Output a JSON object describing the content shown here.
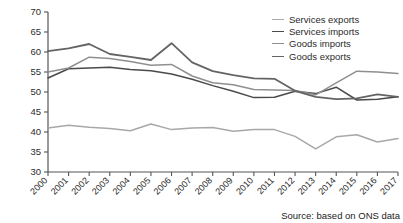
{
  "chart_data": {
    "type": "line",
    "title": "",
    "xlabel": "",
    "ylabel_line1": "% of UK exports and",
    "ylabel_line2": "imports with the EU",
    "ylim": [
      30,
      70
    ],
    "yticks": [
      30,
      35,
      40,
      45,
      50,
      55,
      60,
      65,
      70
    ],
    "grid": false,
    "legend_position": "top-right",
    "categories": [
      "2000",
      "2001",
      "2002",
      "2003",
      "2004",
      "2005",
      "2006",
      "2007",
      "2008",
      "2009",
      "2010",
      "2011",
      "2012",
      "2013",
      "2014",
      "2015",
      "2016",
      "2017"
    ],
    "series": [
      {
        "name": "Services exports",
        "color": "#a8a8a8",
        "width": 1.5,
        "values": [
          41.0,
          41.7,
          41.2,
          40.9,
          40.3,
          42.0,
          40.6,
          41.0,
          41.1,
          40.2,
          40.6,
          40.6,
          38.9,
          35.8,
          38.8,
          39.3,
          37.5,
          38.4
        ]
      },
      {
        "name": "Services imports",
        "color": "#4a4a4a",
        "width": 1.5,
        "values": [
          53.5,
          55.8,
          56.0,
          56.2,
          55.6,
          55.3,
          54.5,
          53.2,
          51.6,
          50.2,
          48.6,
          48.7,
          50.2,
          49.6,
          51.2,
          48.0,
          48.2,
          48.8
        ]
      },
      {
        "name": "Goods imports",
        "color": "#8f8f8f",
        "width": 1.5,
        "values": [
          55.0,
          56.0,
          58.7,
          58.4,
          57.6,
          56.7,
          56.9,
          54.0,
          52.3,
          51.8,
          50.6,
          50.5,
          50.4,
          49.3,
          52.3,
          55.2,
          55.0,
          54.6
        ]
      },
      {
        "name": "Goods exports",
        "color": "#646464",
        "width": 1.8,
        "values": [
          60.2,
          60.9,
          62.0,
          59.5,
          58.8,
          58.0,
          62.2,
          57.4,
          55.2,
          54.2,
          53.4,
          53.3,
          50.3,
          48.8,
          48.2,
          48.4,
          49.4,
          48.8
        ]
      }
    ]
  },
  "legend": {
    "items": [
      {
        "label": "Services exports"
      },
      {
        "label": "Services imports"
      },
      {
        "label": "Goods imports"
      },
      {
        "label": "Goods exports"
      }
    ]
  },
  "source": {
    "text": "Source: based on ONS data"
  }
}
